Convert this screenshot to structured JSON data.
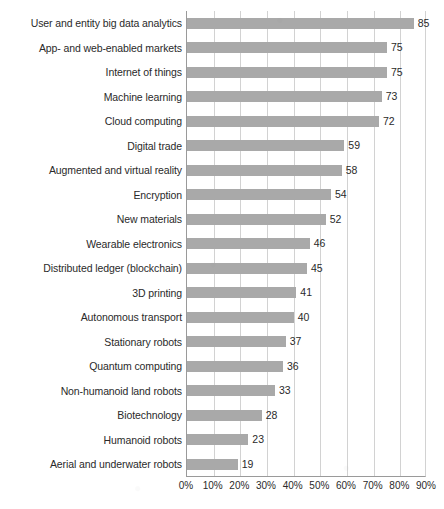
{
  "chart_data": {
    "type": "bar",
    "orientation": "horizontal",
    "title": "",
    "subtitle": "",
    "xlabel": "",
    "ylabel": "",
    "xlim": [
      0,
      90
    ],
    "grid": true,
    "legend": null,
    "value_suffix": "",
    "tick_suffix": "%",
    "xticks": [
      0,
      10,
      20,
      30,
      40,
      50,
      60,
      70,
      80,
      90
    ],
    "xtick_labels": [
      "0%",
      "10%",
      "20%",
      "30%",
      "40%",
      "50%",
      "60%",
      "70%",
      "80%",
      "90%"
    ],
    "bar_color": "#a9a9a9",
    "gridline_color": "#d2d2d2",
    "axis_color": "#9a9a9a",
    "categories": [
      "User and entity big data analytics",
      "App- and web-enabled markets",
      "Internet of things",
      "Machine learning",
      "Cloud computing",
      "Digital trade",
      "Augmented and virtual reality",
      "Encryption",
      "New materials",
      "Wearable electronics",
      "Distributed ledger (blockchain)",
      "3D printing",
      "Autonomous transport",
      "Stationary robots",
      "Quantum computing",
      "Non-humanoid land robots",
      "Biotechnology",
      "Humanoid robots",
      "Aerial and underwater robots"
    ],
    "values": [
      85,
      75,
      75,
      73,
      72,
      59,
      58,
      54,
      52,
      46,
      45,
      41,
      40,
      37,
      36,
      33,
      28,
      23,
      19
    ],
    "value_labels": [
      "85",
      "75",
      "75",
      "73",
      "72",
      "59",
      "58",
      "54",
      "52",
      "46",
      "45",
      "41",
      "40",
      "37",
      "36",
      "33",
      "28",
      "23",
      "19"
    ]
  }
}
